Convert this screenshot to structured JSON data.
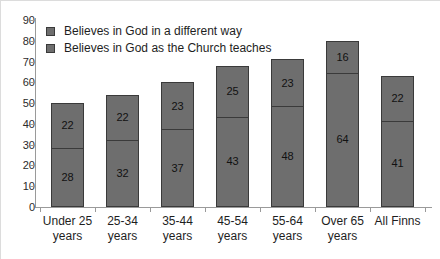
{
  "chart_data": {
    "type": "bar",
    "subtype": "stacked-bar",
    "title": "",
    "xlabel": "",
    "ylabel": "",
    "ylim": [
      0,
      90
    ],
    "ytick_step": 10,
    "yticks": [
      90,
      80,
      70,
      60,
      50,
      40,
      30,
      20,
      10,
      0
    ],
    "grid": false,
    "legend_position": "top-left",
    "categories": [
      "Under 25 years",
      "25-34 years",
      "35-44 years",
      "45-54 years",
      "55-64 years",
      "Over 65 years",
      "All Finns"
    ],
    "category_lines": [
      [
        "Under 25",
        "years"
      ],
      [
        "25-34",
        "years"
      ],
      [
        "35-44",
        "years"
      ],
      [
        "45-54",
        "years"
      ],
      [
        "55-64",
        "years"
      ],
      [
        "Over 65",
        "years"
      ],
      [
        "All Finns",
        ""
      ]
    ],
    "series": [
      {
        "name": "Believes in God in a different way",
        "values": [
          22,
          22,
          23,
          25,
          23,
          16,
          22
        ],
        "color": "#6e6e6e"
      },
      {
        "name": "Believes in God as the Church teaches",
        "values": [
          28,
          32,
          37,
          43,
          48,
          64,
          41
        ],
        "color": "#6e6e6e"
      }
    ],
    "totals": [
      50,
      54,
      60,
      68,
      71,
      80,
      63
    ],
    "stack_order": [
      "Believes in God as the Church teaches",
      "Believes in God in a different way"
    ]
  },
  "legend": {
    "items": [
      {
        "label": "Believes in God in a different way"
      },
      {
        "label": "Believes in God as the Church teaches"
      }
    ]
  },
  "axis": {
    "y_ticks": [
      "90",
      "80",
      "70",
      "60",
      "50",
      "40",
      "30",
      "20",
      "10",
      "0"
    ]
  },
  "bar_labels": {
    "top": [
      "22",
      "22",
      "23",
      "25",
      "23",
      "16",
      "22"
    ],
    "bottom": [
      "28",
      "32",
      "37",
      "43",
      "48",
      "64",
      "41"
    ]
  },
  "colors": {
    "bar_fill": "#6e6e6e",
    "bar_border": "#3a3a3a",
    "axis": "#9a9a9a",
    "text": "#1e1e1e",
    "background": "#ffffff"
  }
}
